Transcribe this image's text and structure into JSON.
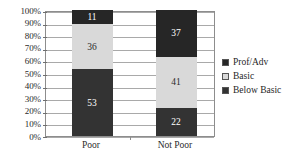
{
  "chart_data": {
    "type": "bar",
    "subtype": "100% stacked bar",
    "title": "",
    "subtitle": "",
    "xlabel": "",
    "ylabel": "",
    "categories": [
      "Poor",
      "Not Poor"
    ],
    "series": [
      {
        "name": "Below Basic",
        "values": [
          53,
          22
        ],
        "color": "#333333"
      },
      {
        "name": "Basic",
        "values": [
          36,
          41
        ],
        "color": "#d9d9d9"
      },
      {
        "name": "Prof/Adv",
        "values": [
          11,
          37
        ],
        "color": "#262626"
      }
    ],
    "stack_order_bottom_to_top": [
      "Below Basic",
      "Basic",
      "Prof/Adv"
    ],
    "ylim": [
      0,
      100
    ],
    "ytick_labels": [
      "0%",
      "10%",
      "20%",
      "30%",
      "40%",
      "50%",
      "60%",
      "70%",
      "80%",
      "90%",
      "100%"
    ],
    "ytick_values": [
      0,
      10,
      20,
      30,
      40,
      50,
      60,
      70,
      80,
      90,
      100
    ],
    "grid": true,
    "grid_axis": "y",
    "legend_position": "right",
    "data_labels": true
  },
  "axes": {
    "y_ticks": [
      {
        "label": "100%",
        "value": 100
      },
      {
        "label": "90%",
        "value": 90
      },
      {
        "label": "80%",
        "value": 80
      },
      {
        "label": "70%",
        "value": 70
      },
      {
        "label": "60%",
        "value": 60
      },
      {
        "label": "50%",
        "value": 50
      },
      {
        "label": "40%",
        "value": 40
      },
      {
        "label": "30%",
        "value": 30
      },
      {
        "label": "20%",
        "value": 20
      },
      {
        "label": "10%",
        "value": 10
      },
      {
        "label": "0%",
        "value": 0
      }
    ],
    "x_ticks": [
      {
        "label": "Poor"
      },
      {
        "label": "Not Poor"
      }
    ]
  },
  "bars": [
    {
      "category": "Poor",
      "segments": [
        {
          "series": "Prof/Adv",
          "value": 11,
          "label": "11",
          "tone": "dark"
        },
        {
          "series": "Basic",
          "value": 36,
          "label": "36",
          "tone": "light"
        },
        {
          "series": "Below Basic",
          "value": 53,
          "label": "53",
          "tone": "dark"
        }
      ]
    },
    {
      "category": "Not Poor",
      "segments": [
        {
          "series": "Prof/Adv",
          "value": 37,
          "label": "37",
          "tone": "dark"
        },
        {
          "series": "Basic",
          "value": 41,
          "label": "41",
          "tone": "light"
        },
        {
          "series": "Below Basic",
          "value": 22,
          "label": "22",
          "tone": "dark"
        }
      ]
    }
  ],
  "legend": {
    "items": [
      {
        "label": "Prof/Adv",
        "color": "#262626"
      },
      {
        "label": "Basic",
        "color": "#d9d9d9"
      },
      {
        "label": "Below Basic",
        "color": "#333333"
      }
    ]
  },
  "colors": {
    "prof_adv": "#262626",
    "basic": "#d9d9d9",
    "below_basic": "#333333",
    "gridline": "#a9a9a9",
    "plot_border": "#8d8d8d",
    "text": "#2b2b2b",
    "label_on_dark": "#ffffff",
    "label_on_light": "#2b2b2b",
    "background": "#ffffff"
  }
}
